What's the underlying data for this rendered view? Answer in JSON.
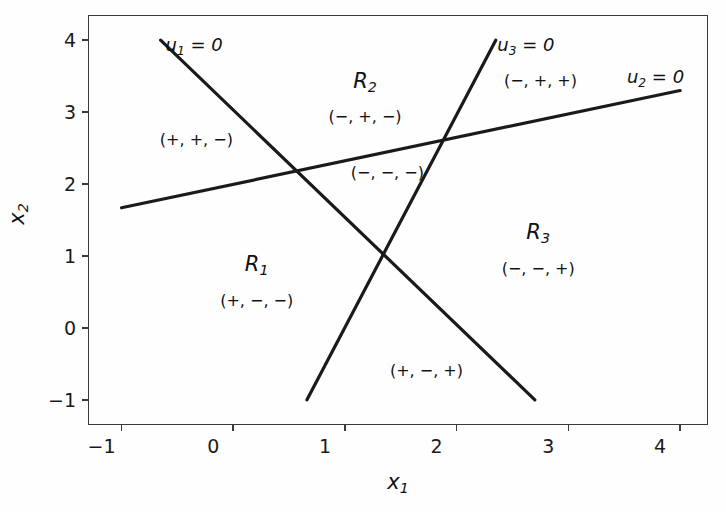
{
  "chart_data": {
    "type": "line",
    "title": "",
    "xlabel": "x1",
    "ylabel": "x2",
    "xlim": [
      -1.3,
      4.25
    ],
    "ylim": [
      -1.35,
      4.35
    ],
    "xticks": [
      -1,
      0,
      1,
      2,
      3,
      4
    ],
    "yticks": [
      -1,
      0,
      1,
      2,
      3,
      4
    ],
    "xtick_labels": [
      "−1",
      "0",
      "1",
      "2",
      "3",
      "4"
    ],
    "ytick_labels": [
      "−1",
      "0",
      "1",
      "2",
      "3",
      "4"
    ],
    "grid": false,
    "legend": "none",
    "series": [
      {
        "name": "u1 = 0",
        "points": [
          [
            -0.65,
            4.0
          ],
          [
            2.7,
            -1.0
          ]
        ]
      },
      {
        "name": "u2 = 0",
        "points": [
          [
            -1.0,
            1.67
          ],
          [
            4.0,
            3.3
          ]
        ]
      },
      {
        "name": "u3 = 0",
        "points": [
          [
            0.66,
            -1.0
          ],
          [
            2.35,
            4.0
          ]
        ]
      }
    ],
    "annotations": [
      {
        "text": "u1 = 0",
        "x": -0.35,
        "y": 3.92,
        "kind": "line-name"
      },
      {
        "text": "u3 = 0",
        "x": 2.62,
        "y": 3.92,
        "kind": "line-name"
      },
      {
        "text": "u2 = 0",
        "x": 3.78,
        "y": 3.48,
        "kind": "line-name"
      },
      {
        "text": "R2",
        "x": 1.18,
        "y": 3.42,
        "kind": "region"
      },
      {
        "text": "(−, +, −)",
        "x": 1.18,
        "y": 2.95,
        "kind": "sign"
      },
      {
        "text": "(+, +, −)",
        "x": -0.33,
        "y": 2.63,
        "kind": "sign"
      },
      {
        "text": "(−, +, +)",
        "x": 2.75,
        "y": 3.45,
        "kind": "sign"
      },
      {
        "text": "(−, −, −)",
        "x": 1.38,
        "y": 2.17,
        "kind": "sign"
      },
      {
        "text": "R1",
        "x": 0.21,
        "y": 0.88,
        "kind": "region"
      },
      {
        "text": "(+, −, −)",
        "x": 0.21,
        "y": 0.39,
        "kind": "sign"
      },
      {
        "text": "R3",
        "x": 2.73,
        "y": 1.32,
        "kind": "region"
      },
      {
        "text": "(−, −, +)",
        "x": 2.73,
        "y": 0.83,
        "kind": "sign"
      },
      {
        "text": "(+, −, +)",
        "x": 1.73,
        "y": -0.58,
        "kind": "sign"
      }
    ],
    "colors": {
      "line": "#1a1a1a",
      "axis": "#3a3a3a",
      "text": "#111111",
      "background": "#fefefe"
    }
  }
}
